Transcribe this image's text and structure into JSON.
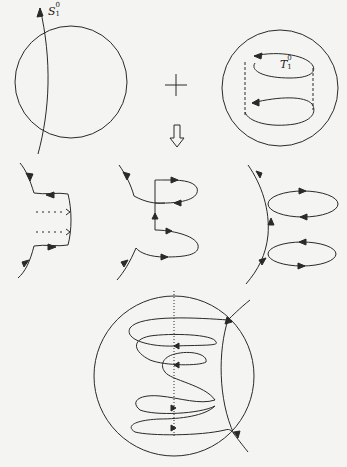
{
  "figure": {
    "colors": {
      "background": "#f4f4f2",
      "stroke": "#2a2a2a"
    },
    "labels": {
      "sphere_arc": {
        "symbol": "S",
        "sub": "1",
        "sup": "0"
      },
      "torus_loop": {
        "symbol": "T",
        "sub": "1",
        "sup": "0"
      }
    },
    "operators": {
      "plus": "+",
      "down_arrow": "⇩"
    },
    "panels": [
      {
        "id": "top-left",
        "description": "circle with an oriented arc passing through it"
      },
      {
        "id": "top-right",
        "description": "circle containing two oriented loops joined by dashed lines (cylinder)"
      },
      {
        "id": "middle-left",
        "description": "arc with a rectangular band and two dotted arrows"
      },
      {
        "id": "middle-center",
        "description": "arc with two oriented loops attached"
      },
      {
        "id": "middle-right",
        "description": "curved arc with two oriented elliptic loops"
      },
      {
        "id": "bottom",
        "description": "circle with a helical curve wound around a dotted vertical axis, arcs crossing at right"
      }
    ]
  }
}
